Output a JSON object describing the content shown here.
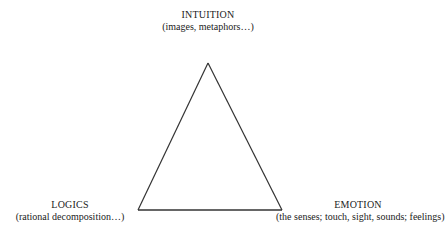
{
  "diagram": {
    "type": "triangle",
    "stroke_color": "#333333",
    "background": "#ffffff",
    "vertices": {
      "top": {
        "title": "INTUITION",
        "subtitle": "(images, metaphors…)"
      },
      "bottom_left": {
        "title": "LOGICS",
        "subtitle": "(rational decomposition…)"
      },
      "bottom_right": {
        "title": "EMOTION",
        "subtitle": "(the senses; touch, sight, sounds; feelings)"
      }
    }
  }
}
